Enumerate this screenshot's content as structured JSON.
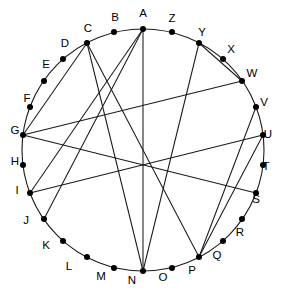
{
  "figure": {
    "type": "circular-graph-diagram",
    "title": "",
    "background_color": "#ffffff",
    "stroke_color": "#1a1a1a",
    "node_color": "#000000",
    "label_color": "#000000",
    "circle": {
      "cx": 143,
      "cy": 150,
      "r": 121
    },
    "node_radius": 3.0,
    "label_offset": 15
  },
  "chart_data": {
    "type": "diagram",
    "subtype": "circular-node-link-graph",
    "title": "",
    "node_count": 26,
    "edge_count": 11,
    "layout": "nodes evenly spaced on a circle, label A at top, continuing clockwise through Z",
    "nodes": [
      {
        "id": "A",
        "label": "A",
        "angle_deg": 0,
        "x": 143,
        "y": 29,
        "label_x": 143,
        "label_y": 14
      },
      {
        "id": "B",
        "label": "B",
        "angle_deg": 13.85,
        "x": 172,
        "y": 32,
        "label_x": 115,
        "label_y": 18
      },
      {
        "id": "C",
        "label": "C",
        "angle_deg": 27.69,
        "x": 199,
        "y": 43,
        "label_x": 88,
        "label_y": 29
      },
      {
        "id": "D",
        "label": "D",
        "angle_deg": 41.54,
        "x": 223,
        "y": 59,
        "label_x": 65,
        "label_y": 44
      },
      {
        "id": "E",
        "label": "E",
        "angle_deg": 55.38,
        "x": 242,
        "y": 81,
        "label_x": 46,
        "label_y": 65
      },
      {
        "id": "F",
        "label": "F",
        "angle_deg": 69.23,
        "x": 256,
        "y": 107,
        "label_x": 27,
        "label_y": 99
      },
      {
        "id": "G",
        "label": "G",
        "angle_deg": 83.08,
        "x": 263,
        "y": 135,
        "label_x": 15,
        "label_y": 131
      },
      {
        "id": "H",
        "label": "H",
        "angle_deg": 96.92,
        "x": 263,
        "y": 165,
        "label_x": 15,
        "label_y": 162
      },
      {
        "id": "I",
        "label": "I",
        "angle_deg": 110.77,
        "x": 256,
        "y": 193,
        "label_x": 17,
        "label_y": 191
      },
      {
        "id": "J",
        "label": "J",
        "angle_deg": 124.62,
        "x": 242,
        "y": 219,
        "label_x": 26,
        "label_y": 221
      },
      {
        "id": "K",
        "label": "K",
        "angle_deg": 138.46,
        "x": 223,
        "y": 241,
        "label_x": 46,
        "label_y": 246
      },
      {
        "id": "L",
        "label": "L",
        "angle_deg": 152.31,
        "x": 199,
        "y": 257,
        "label_x": 69,
        "label_y": 267
      },
      {
        "id": "M",
        "label": "M",
        "angle_deg": 166.15,
        "x": 172,
        "y": 268,
        "label_x": 101,
        "label_y": 277
      },
      {
        "id": "N",
        "label": "N",
        "angle_deg": 180,
        "x": 143,
        "y": 271,
        "label_x": 132,
        "label_y": 281
      },
      {
        "id": "O",
        "label": "O",
        "angle_deg": 193.85,
        "x": 114,
        "y": 268,
        "label_x": 163,
        "label_y": 278
      },
      {
        "id": "P",
        "label": "P",
        "angle_deg": 207.69,
        "x": 87,
        "y": 257,
        "label_x": 192,
        "label_y": 271
      },
      {
        "id": "Q",
        "label": "Q",
        "angle_deg": 221.54,
        "x": 63,
        "y": 241,
        "label_x": 217,
        "label_y": 256
      },
      {
        "id": "R",
        "label": "R",
        "angle_deg": 235.38,
        "x": 44,
        "y": 219,
        "label_x": 240,
        "label_y": 233
      },
      {
        "id": "S",
        "label": "S",
        "angle_deg": 249.23,
        "x": 30,
        "y": 193,
        "label_x": 256,
        "label_y": 200
      },
      {
        "id": "T",
        "label": "T",
        "angle_deg": 263.08,
        "x": 23,
        "y": 165,
        "label_x": 266,
        "label_y": 167
      },
      {
        "id": "U",
        "label": "U",
        "angle_deg": 276.92,
        "x": 23,
        "y": 135,
        "label_x": 268,
        "label_y": 135
      },
      {
        "id": "V",
        "label": "V",
        "angle_deg": 290.77,
        "x": 30,
        "y": 107,
        "label_x": 264,
        "label_y": 103
      },
      {
        "id": "W",
        "label": "W",
        "angle_deg": 304.62,
        "x": 44,
        "y": 81,
        "label_x": 252,
        "label_y": 74
      },
      {
        "id": "X",
        "label": "X",
        "angle_deg": 318.46,
        "x": 63,
        "y": 59,
        "label_x": 231,
        "label_y": 50
      },
      {
        "id": "Y",
        "label": "Y",
        "angle_deg": 332.31,
        "x": 87,
        "y": 43,
        "label_x": 202,
        "label_y": 33
      },
      {
        "id": "Z",
        "label": "Z",
        "angle_deg": 346.15,
        "x": 114,
        "y": 32,
        "label_x": 172,
        "label_y": 19
      }
    ],
    "edges": [
      {
        "from": "A",
        "to": "N"
      },
      {
        "from": "A",
        "to": "S"
      },
      {
        "from": "A",
        "to": "R"
      },
      {
        "from": "C",
        "to": "E"
      },
      {
        "from": "C",
        "to": "N"
      },
      {
        "from": "E",
        "to": "U"
      },
      {
        "from": "F",
        "to": "L"
      },
      {
        "from": "G",
        "to": "S"
      },
      {
        "from": "G",
        "to": "L"
      },
      {
        "from": "I",
        "to": "U"
      },
      {
        "from": "Y",
        "to": "U"
      },
      {
        "from": "Y",
        "to": "L"
      },
      {
        "from": "Y",
        "to": "N"
      }
    ]
  }
}
